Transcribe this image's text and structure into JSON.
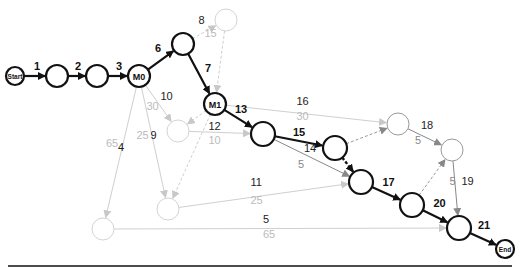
{
  "colors": {
    "critical": "#111111",
    "normal": "#777777",
    "ghost": "#cccccc",
    "label_secondary": "#999999",
    "label_ghost": "#bbbbbb"
  },
  "nodes": [
    {
      "id": "start",
      "label": "Start",
      "style": "critical"
    },
    {
      "id": "n1",
      "label": "",
      "style": "critical"
    },
    {
      "id": "n2",
      "label": "",
      "style": "critical"
    },
    {
      "id": "m0",
      "label": "M0",
      "style": "critical"
    },
    {
      "id": "n6",
      "label": "",
      "style": "critical"
    },
    {
      "id": "n8",
      "label": "",
      "style": "ghost"
    },
    {
      "id": "m1",
      "label": "M1",
      "style": "critical"
    },
    {
      "id": "n10",
      "label": "",
      "style": "ghost"
    },
    {
      "id": "n13",
      "label": "",
      "style": "critical"
    },
    {
      "id": "n15",
      "label": "",
      "style": "critical"
    },
    {
      "id": "n16",
      "label": "",
      "style": "normal"
    },
    {
      "id": "n18",
      "label": "",
      "style": "normal"
    },
    {
      "id": "n17",
      "label": "",
      "style": "critical"
    },
    {
      "id": "n9",
      "label": "",
      "style": "ghost"
    },
    {
      "id": "n4",
      "label": "",
      "style": "ghost"
    },
    {
      "id": "n20",
      "label": "",
      "style": "critical"
    },
    {
      "id": "n21",
      "label": "",
      "style": "critical"
    },
    {
      "id": "end",
      "label": "End",
      "style": "critical"
    }
  ],
  "edges": [
    {
      "from": "start",
      "to": "n1",
      "label": "1",
      "sub": "",
      "style": "critical"
    },
    {
      "from": "n1",
      "to": "n2",
      "label": "2",
      "sub": "",
      "style": "critical"
    },
    {
      "from": "n2",
      "to": "m0",
      "label": "3",
      "sub": "",
      "style": "critical"
    },
    {
      "from": "m0",
      "to": "n6",
      "label": "6",
      "sub": "",
      "style": "critical"
    },
    {
      "from": "n6",
      "to": "n8",
      "label": "8",
      "sub": "15",
      "style": "ghost-dashed"
    },
    {
      "from": "n6",
      "to": "m1",
      "label": "7",
      "sub": "",
      "style": "critical"
    },
    {
      "from": "n8",
      "to": "m1",
      "label": "",
      "sub": "",
      "style": "ghost-dashed"
    },
    {
      "from": "m0",
      "to": "n10",
      "label": "10",
      "sub": "30",
      "style": "ghost"
    },
    {
      "from": "m0",
      "to": "n9",
      "label": "9",
      "sub": "25",
      "style": "ghost"
    },
    {
      "from": "m0",
      "to": "n4",
      "label": "4",
      "sub": "65",
      "style": "ghost"
    },
    {
      "from": "m1",
      "to": "n10",
      "label": "",
      "sub": "",
      "style": "ghost-dashed"
    },
    {
      "from": "m1",
      "to": "n9",
      "label": "",
      "sub": "",
      "style": "ghost-dashed"
    },
    {
      "from": "m1",
      "to": "n13",
      "label": "13",
      "sub": "",
      "style": "critical"
    },
    {
      "from": "m1",
      "to": "n16",
      "label": "16",
      "sub": "30",
      "style": "ghost"
    },
    {
      "from": "n10",
      "to": "n13",
      "label": "12",
      "sub": "10",
      "style": "ghost"
    },
    {
      "from": "n13",
      "to": "n15",
      "label": "15",
      "sub": "",
      "style": "critical"
    },
    {
      "from": "n13",
      "to": "n17",
      "label": "14",
      "sub": "5",
      "style": "normal"
    },
    {
      "from": "n15",
      "to": "n16",
      "label": "",
      "sub": "",
      "style": "normal-dashed"
    },
    {
      "from": "n15",
      "to": "n17",
      "label": "",
      "sub": "",
      "style": "critical-dashed"
    },
    {
      "from": "n16",
      "to": "n18",
      "label": "18",
      "sub": "5",
      "style": "normal"
    },
    {
      "from": "n9",
      "to": "n17",
      "label": "11",
      "sub": "25",
      "style": "ghost"
    },
    {
      "from": "n17",
      "to": "n20",
      "label": "17",
      "sub": "",
      "style": "critical"
    },
    {
      "from": "n20",
      "to": "n18",
      "label": "",
      "sub": "",
      "style": "normal-dashed"
    },
    {
      "from": "n18",
      "to": "n21",
      "label": "19",
      "sub": "5",
      "style": "normal"
    },
    {
      "from": "n4",
      "to": "n21",
      "label": "5",
      "sub": "65",
      "style": "ghost"
    },
    {
      "from": "n20",
      "to": "n21",
      "label": "20",
      "sub": "",
      "style": "critical"
    },
    {
      "from": "n21",
      "to": "end",
      "label": "21",
      "sub": "",
      "style": "critical"
    }
  ]
}
